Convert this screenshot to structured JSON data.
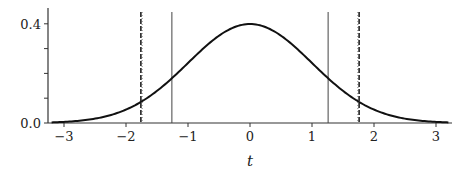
{
  "chart_data": {
    "type": "line",
    "title": "",
    "xlabel": "t",
    "ylabel": "",
    "xlim": [
      -3.25,
      3.25
    ],
    "ylim": [
      0.0,
      0.45
    ],
    "x_ticks": [
      -3,
      -2,
      -1,
      0,
      1,
      2,
      3
    ],
    "x_tick_labels": [
      "−3",
      "−2",
      "−1",
      "0",
      "1",
      "2",
      "3"
    ],
    "y_ticks": [
      0.0,
      0.1,
      0.2,
      0.3,
      0.4
    ],
    "y_tick_labels": [
      "0.0",
      "",
      "",
      "",
      "0.4"
    ],
    "series": [
      {
        "name": "standard normal density",
        "function": "exp(-t^2/2)/sqrt(2*pi)",
        "x_range": [
          -3.2,
          3.2
        ],
        "color": "#111111",
        "style": "solid"
      }
    ],
    "vertical_lines": [
      {
        "x": -1.76,
        "style": "dashed",
        "color": "#222222"
      },
      {
        "x": -1.74,
        "style": "dotted",
        "color": "#555555"
      },
      {
        "x": 1.76,
        "style": "dashed",
        "color": "#222222"
      },
      {
        "x": 1.74,
        "style": "dotted",
        "color": "#555555"
      },
      {
        "x": -1.26,
        "style": "solid-thin",
        "color": "#444444"
      },
      {
        "x": 1.26,
        "style": "solid-thin",
        "color": "#444444"
      }
    ],
    "grid": false,
    "legend": null
  }
}
